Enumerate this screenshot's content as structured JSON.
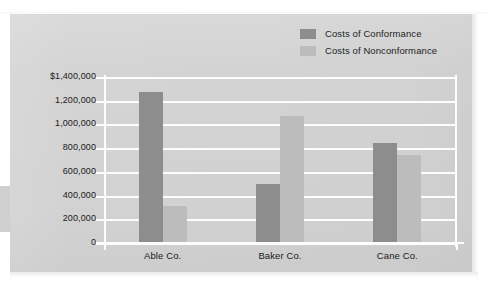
{
  "chart_data": {
    "type": "bar",
    "title": "",
    "xlabel": "",
    "ylabel": "Costs of Quality",
    "categories": [
      "Able Co.",
      "Baker Co.",
      "Cane Co."
    ],
    "series": [
      {
        "name": "Costs of Conformance",
        "color": "#8d8d8d",
        "values": [
          1270000,
          500000,
          840000
        ]
      },
      {
        "name": "Costs of Nonconformance",
        "color": "#bcbcbc",
        "values": [
          315000,
          1075000,
          745000
        ]
      }
    ],
    "ylim": [
      0,
      1400000
    ],
    "ytick_values": [
      1400000,
      1200000,
      1000000,
      800000,
      600000,
      400000,
      200000,
      0
    ],
    "ytick_labels": [
      "$1,400,000",
      "1,200,000",
      "1,000,000",
      "800,000",
      "600,000",
      "400,000",
      "200,000",
      "0"
    ],
    "grid": true,
    "legend_position": "top-right",
    "background_color": "#d4d4d4",
    "gridline_color": "#fdfdfd"
  },
  "legend": {
    "entries": [
      {
        "label": "Costs of Conformance",
        "color": "#8d8d8d"
      },
      {
        "label": "Costs of Nonconformance",
        "color": "#bcbcbc"
      }
    ]
  },
  "axis": {
    "y_title": "Costs of Quality"
  }
}
